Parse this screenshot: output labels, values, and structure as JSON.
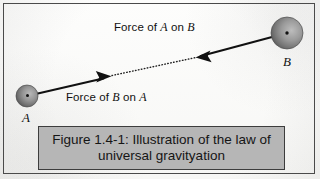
{
  "figure": {
    "alt_title": "Illustration of the law of universal gravitation",
    "background_color": "#fbfbfa",
    "border_color": "#4a4a4a",
    "bodies": [
      {
        "id": "A",
        "label": "A",
        "center_x": 27,
        "center_y": 96,
        "radius": 11,
        "fill_color": "#8c8c8c"
      },
      {
        "id": "B",
        "label": "B",
        "center_x": 287,
        "center_y": 33,
        "radius": 16,
        "fill_color": "#8c8c8c"
      }
    ],
    "vectors": [
      {
        "id": "force-a-on-b",
        "label_prefix": "Force of ",
        "label_first_body": "A",
        "label_middle": " on ",
        "label_second_body": "B",
        "tail_x": 27,
        "tail_y": 96,
        "head_x": 110,
        "head_y": 77,
        "direction": "right",
        "color": "#111111"
      },
      {
        "id": "force-b-on-a",
        "label_prefix": "Force of ",
        "label_first_body": "B",
        "label_middle": " on ",
        "label_second_body": "A",
        "tail_x": 287,
        "tail_y": 33,
        "head_x": 197,
        "head_y": 57,
        "direction": "left",
        "color": "#111111"
      }
    ],
    "connector": {
      "id": "dotted-connector",
      "style": "dotted",
      "from_x": 112,
      "from_y": 76,
      "to_x": 196,
      "to_y": 57,
      "color": "#222222"
    }
  },
  "caption": {
    "line1": "Figure 1.4-1: Illustration of the law of",
    "line2": "universal gravityation",
    "background_color": "#b6b6b6",
    "border_color": "#3d3d3d"
  }
}
